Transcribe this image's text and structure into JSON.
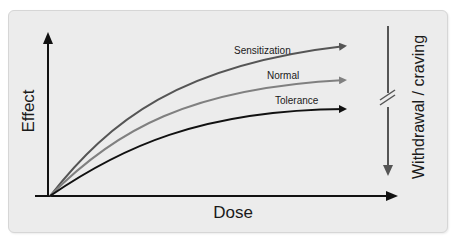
{
  "diagram": {
    "axes": {
      "x_label": "Dose",
      "y_label": "Effect"
    },
    "curves": [
      {
        "name": "Sensitization",
        "label": "Sensitization",
        "color": "#555555"
      },
      {
        "name": "Normal",
        "label": "Normal",
        "color": "#808080"
      },
      {
        "name": "Tolerance",
        "label": "Tolerance",
        "color": "#111111"
      }
    ],
    "side_indicator": {
      "label": "Withdrawal / craving",
      "color": "#555555",
      "has_break_marks": true,
      "direction": "down"
    },
    "colors": {
      "panel_background": "#ececec",
      "axis": "#111111"
    }
  }
}
